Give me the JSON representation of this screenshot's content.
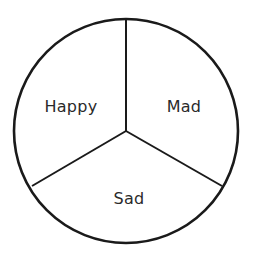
{
  "diagram": {
    "type": "divided-circle",
    "sections": [
      {
        "label": "Happy",
        "position": "upper-left"
      },
      {
        "label": "Mad",
        "position": "upper-right"
      },
      {
        "label": "Sad",
        "position": "bottom"
      }
    ],
    "colors": {
      "stroke": "#1a1a1a",
      "text": "#2a2a2a",
      "background": "#ffffff"
    }
  }
}
